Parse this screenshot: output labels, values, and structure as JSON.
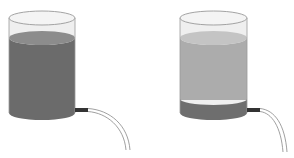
{
  "figure": {
    "colors": {
      "background": "#ffffff",
      "glass_outline": "#9a9a9a",
      "glass_fill": "#ededed",
      "dark_liquid": "#6a6a6a",
      "dark_liquid_top": "#8a8a8a",
      "light_liquid": "#aaaaaa",
      "light_liquid_top": "#c2c2c2",
      "nozzle": "#3a3a3a",
      "tube": "#8f8f8f"
    },
    "containers": [
      {
        "name": "left",
        "layers": [
          "dark liquid (full)"
        ]
      },
      {
        "name": "right",
        "layers": [
          "light liquid (upper)",
          "dark sediment (bottom)"
        ]
      }
    ]
  }
}
